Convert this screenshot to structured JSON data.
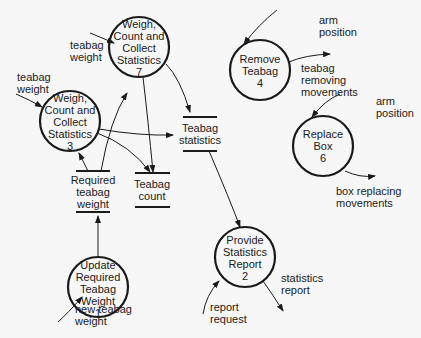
{
  "diagram": {
    "type": "data-flow-diagram",
    "processes": [
      {
        "id": "7",
        "label": "Weigh,\nCount and\nCollect\nStatistics\n7"
      },
      {
        "id": "3",
        "label": "Weigh,\nCount and\nCollect\nStatistics\n3"
      },
      {
        "id": "1",
        "label": "Update\nRequired\nTeabag\nWeight\n1"
      },
      {
        "id": "4",
        "label": "Remove\nTeabag\n4"
      },
      {
        "id": "6",
        "label": "Replace\nBox\n6"
      },
      {
        "id": "2",
        "label": "Provide\nStatistics\nReport\n2"
      }
    ],
    "stores": [
      {
        "id": "required-teabag-weight",
        "label": "Required\nteabag\nweight"
      },
      {
        "id": "teabag-count",
        "label": "Teabag\ncount"
      },
      {
        "id": "teabag-statistics",
        "label": "Teabag\nstatistics"
      }
    ],
    "flows": [
      {
        "id": "tw7",
        "label": "teabag\nweight"
      },
      {
        "id": "tw3",
        "label": "teabag\nweight"
      },
      {
        "id": "ntw",
        "label": "new teabag\nweight"
      },
      {
        "id": "ap4",
        "label": "arm\nposition"
      },
      {
        "id": "trm",
        "label": "teabag\nremoving\nmovements"
      },
      {
        "id": "ap6",
        "label": "arm\nposition"
      },
      {
        "id": "brm",
        "label": "box replacing\nmovements"
      },
      {
        "id": "sr",
        "label": "statistics\nreport"
      },
      {
        "id": "rr",
        "label": "report\nrequest"
      }
    ]
  }
}
